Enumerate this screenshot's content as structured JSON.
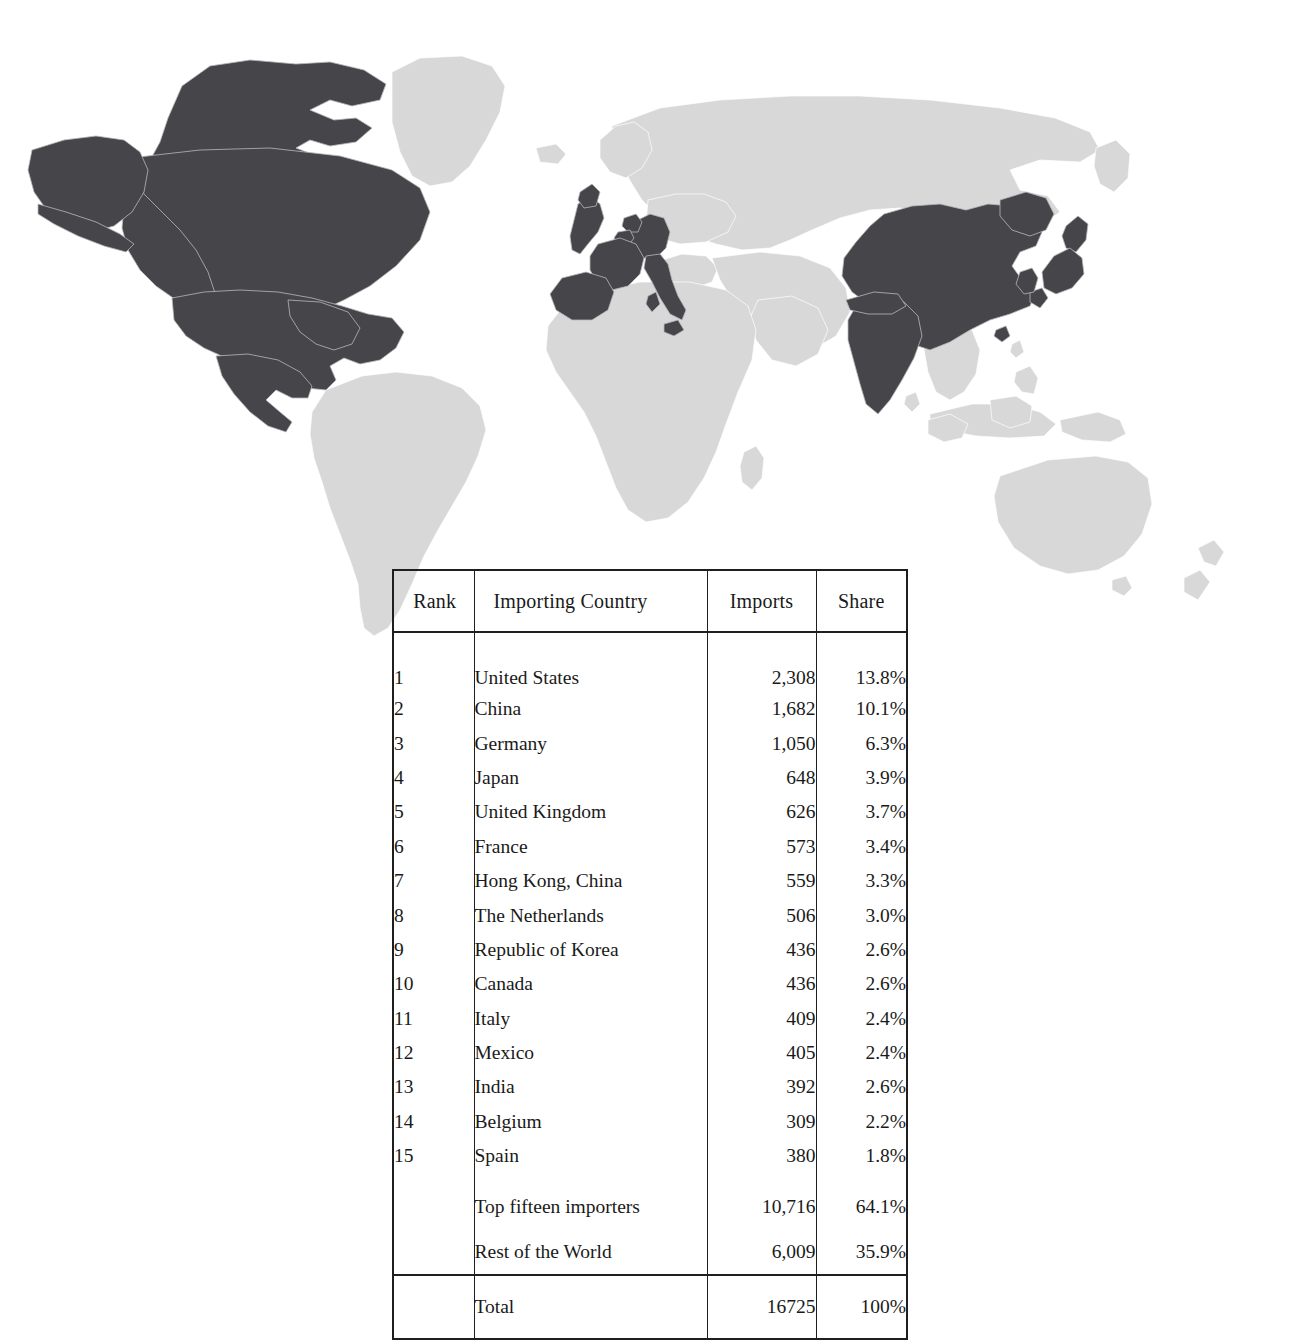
{
  "figure": {
    "map_name": "world-map-top-importers",
    "highlight_color": "#45454a",
    "base_land_color": "#d8d8d8",
    "ocean_color": "#ffffff",
    "highlighted_countries": [
      "United States",
      "Canada",
      "Mexico",
      "Germany",
      "United Kingdom",
      "France",
      "The Netherlands",
      "Belgium",
      "Italy",
      "Spain",
      "China",
      "Japan",
      "Republic of Korea",
      "India",
      "Hong Kong, China"
    ]
  },
  "table": {
    "headers": {
      "rank": "Rank",
      "country": "Importing Country",
      "imports": "Imports",
      "share": "Share"
    },
    "rows": [
      {
        "rank": "1",
        "country": "United States",
        "imports": "2,308",
        "share": "13.8%"
      },
      {
        "rank": "2",
        "country": "China",
        "imports": "1,682",
        "share": "10.1%"
      },
      {
        "rank": "3",
        "country": "Germany",
        "imports": "1,050",
        "share": "6.3%"
      },
      {
        "rank": "4",
        "country": "Japan",
        "imports": "648",
        "share": "3.9%"
      },
      {
        "rank": "5",
        "country": "United Kingdom",
        "imports": "626",
        "share": "3.7%"
      },
      {
        "rank": "6",
        "country": "France",
        "imports": "573",
        "share": "3.4%"
      },
      {
        "rank": "7",
        "country": "Hong Kong, China",
        "imports": "559",
        "share": "3.3%"
      },
      {
        "rank": "8",
        "country": "The Netherlands",
        "imports": "506",
        "share": "3.0%"
      },
      {
        "rank": "9",
        "country": "Republic of Korea",
        "imports": "436",
        "share": "2.6%"
      },
      {
        "rank": "10",
        "country": "Canada",
        "imports": "436",
        "share": "2.6%"
      },
      {
        "rank": "11",
        "country": "Italy",
        "imports": "409",
        "share": "2.4%"
      },
      {
        "rank": "12",
        "country": "Mexico",
        "imports": "405",
        "share": "2.4%"
      },
      {
        "rank": "13",
        "country": "India",
        "imports": "392",
        "share": "2.6%"
      },
      {
        "rank": "14",
        "country": "Belgium",
        "imports": "309",
        "share": "2.2%"
      },
      {
        "rank": "15",
        "country": "Spain",
        "imports": "380",
        "share": "1.8%"
      }
    ],
    "summary_rows": [
      {
        "rank": "",
        "country": "Top fifteen importers",
        "imports": "10,716",
        "share": "64.1%"
      },
      {
        "rank": "",
        "country": "Rest of the World",
        "imports": "6,009",
        "share": "35.9%"
      }
    ],
    "total_row": {
      "rank": "",
      "country": "Total",
      "imports": "16725",
      "share": "100%"
    }
  },
  "chart_data": {
    "type": "table",
    "columns": [
      "Rank",
      "Importing Country",
      "Imports",
      "Share"
    ],
    "categories": [
      "United States",
      "China",
      "Germany",
      "Japan",
      "United Kingdom",
      "France",
      "Hong Kong, China",
      "The Netherlands",
      "Republic of Korea",
      "Canada",
      "Italy",
      "Mexico",
      "India",
      "Belgium",
      "Spain"
    ],
    "series": [
      {
        "name": "Imports",
        "values": [
          2308,
          1682,
          1050,
          648,
          626,
          573,
          559,
          506,
          436,
          436,
          409,
          405,
          392,
          309,
          380
        ]
      },
      {
        "name": "Share",
        "values": [
          13.8,
          10.1,
          6.3,
          3.9,
          3.7,
          3.4,
          3.3,
          3.0,
          2.6,
          2.6,
          2.4,
          2.4,
          2.6,
          2.2,
          1.8
        ]
      }
    ],
    "aggregates": {
      "top_fifteen_importers": {
        "imports": 10716,
        "share": 64.1
      },
      "rest_of_the_world": {
        "imports": 6009,
        "share": 35.9
      },
      "total": {
        "imports": 16725,
        "share": 100
      }
    },
    "xlabel": "Importing Country",
    "ylabel": "Imports",
    "grid": false,
    "legend": "none"
  }
}
